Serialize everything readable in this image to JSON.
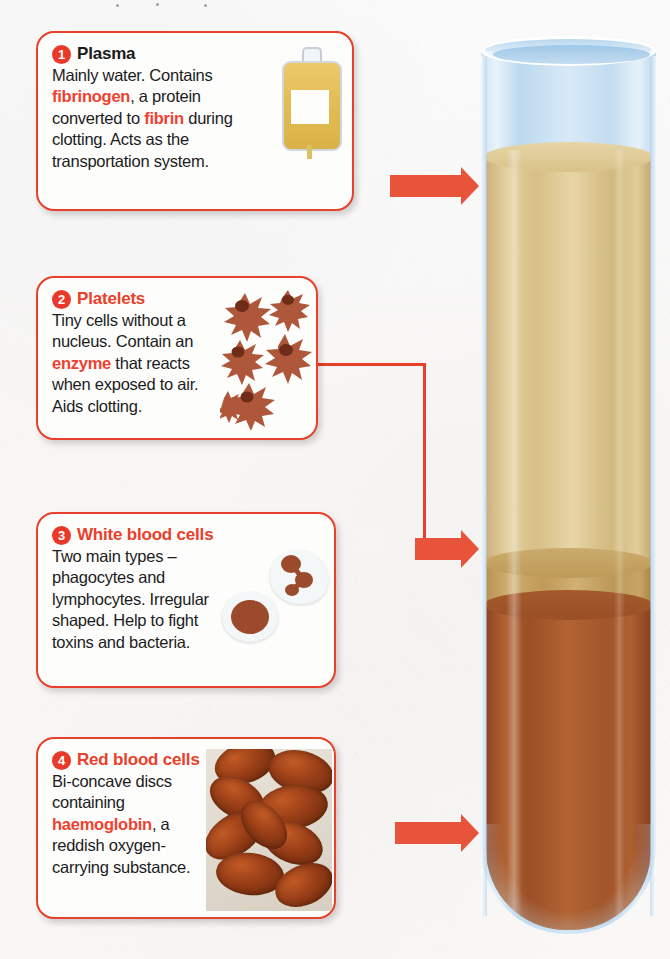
{
  "diagram": {
    "accent_color": "#e8402a",
    "arrow_color": "#e8543a"
  },
  "cards": [
    {
      "number": "1",
      "heading": "Plasma",
      "heading_color": "dark",
      "body_parts": [
        {
          "text": "Mainly water. Contains ",
          "bold": false
        },
        {
          "text": "fibrinogen",
          "bold": true
        },
        {
          "text": ", a protein converted to ",
          "bold": false
        },
        {
          "text": "fibrin",
          "bold": true
        },
        {
          "text": " during clotting. Acts as the transportation system.",
          "bold": false
        }
      ],
      "illustration": "blood-bag"
    },
    {
      "number": "2",
      "heading": "Platelets",
      "heading_color": "accent",
      "body_parts": [
        {
          "text": "Tiny cells without a nucleus. Contain an ",
          "bold": false
        },
        {
          "text": "enzyme",
          "bold": true
        },
        {
          "text": " that reacts when exposed to air. Aids clotting.",
          "bold": false
        }
      ],
      "illustration": "platelets"
    },
    {
      "number": "3",
      "heading": "White blood cells",
      "heading_color": "accent",
      "body_parts": [
        {
          "text": "Two main types – phagocytes and lymphocytes. Irregular shaped. Help to fight toxins and bacteria.",
          "bold": false
        }
      ],
      "illustration": "white-blood-cells"
    },
    {
      "number": "4",
      "heading": "Red blood cells",
      "heading_color": "accent",
      "body_parts": [
        {
          "text": "Bi-concave discs containing ",
          "bold": false
        },
        {
          "text": "haemoglobin",
          "bold": true
        },
        {
          "text": ", a reddish oxygen-carrying substance.",
          "bold": false
        }
      ],
      "illustration": "red-blood-cells"
    }
  ],
  "test_tube": {
    "layers": [
      {
        "name": "plasma",
        "color": "#d9c289"
      },
      {
        "name": "buffy-coat",
        "color": "#bd9a58"
      },
      {
        "name": "red-blood-cells",
        "color": "#a9522b"
      }
    ],
    "glass_color": "#cfe4f4"
  }
}
